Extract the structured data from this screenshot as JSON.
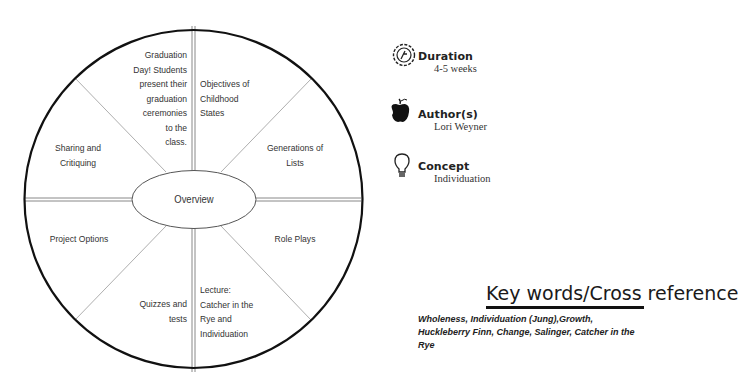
{
  "wheel": {
    "center": "Overview",
    "segments": [
      {
        "id": "top-left",
        "text": "Graduation Day!  Students present their graduation ceremonies to the class."
      },
      {
        "id": "top-right",
        "text": "Objectives of Childhood States"
      },
      {
        "id": "right-upper",
        "text": "Generations of Lists"
      },
      {
        "id": "right-lower",
        "text": "Role Plays"
      },
      {
        "id": "bottom-right",
        "text": "Lecture: Catcher in the Rye and Individuation"
      },
      {
        "id": "bottom-left",
        "text": "Quizzes and tests"
      },
      {
        "id": "left-lower",
        "text": "Project Options"
      },
      {
        "id": "left-upper",
        "text": "Sharing and Critiquing"
      }
    ],
    "lines": {
      "tl": [
        "Graduation",
        "Day!  Students",
        "present their",
        "graduation",
        "ceremonies",
        "to the",
        "class."
      ],
      "tr": [
        "Objectives of",
        "Childhood",
        "States"
      ],
      "ru": [
        "Generations of",
        "Lists"
      ],
      "rl": [
        "Role Plays"
      ],
      "br": [
        "Lecture:",
        "Catcher in the",
        "Rye and",
        "Individuation"
      ],
      "bl": [
        "Quizzes and",
        "tests"
      ],
      "ll": [
        "Project Options"
      ],
      "lu": [
        "Sharing and",
        "Critiquing"
      ]
    }
  },
  "info": {
    "duration": {
      "label": "Duration",
      "value": "4-5 weeks",
      "icon": "clock-badge-icon"
    },
    "authors": {
      "label": "Author(s)",
      "value": "Lori Weyner",
      "icon": "apple-icon"
    },
    "concept": {
      "label": "Concept",
      "value": "Individuation",
      "icon": "lightbulb-icon"
    }
  },
  "keywords": {
    "title": "Key words/Cross reference",
    "text": "Wholeness, Individuation (Jung),Growth, Huckleberry Finn, Change, Salinger, Catcher in the Rye"
  }
}
